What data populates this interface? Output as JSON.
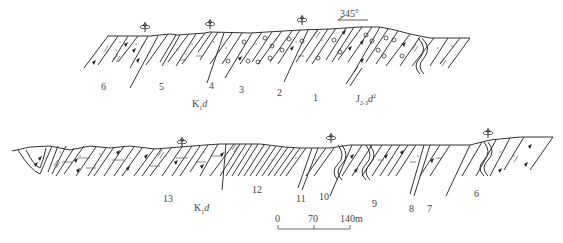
{
  "diagram": {
    "type": "geological-cross-section",
    "profiles": [
      {
        "id": "upper",
        "orientation_label": "345°",
        "bed_numbers": [
          {
            "label": "6",
            "x": 104,
            "y": 88
          },
          {
            "label": "5",
            "x": 162,
            "y": 88
          },
          {
            "label": "4",
            "x": 212,
            "y": 87
          },
          {
            "label": "3",
            "x": 241,
            "y": 91
          },
          {
            "label": "2",
            "x": 280,
            "y": 93
          },
          {
            "label": "1",
            "x": 314,
            "y": 98
          }
        ],
        "formations": [
          {
            "main": "K",
            "sub": "1",
            "name": "d",
            "x": 194,
            "y": 104
          },
          {
            "main": "J",
            "sub": "2-3",
            "name": "d",
            "sup": "2",
            "x": 357,
            "y": 97
          }
        ],
        "fossil_markers": [
          {
            "x": 145,
            "y": 27
          },
          {
            "x": 210,
            "y": 24
          },
          {
            "x": 302,
            "y": 20
          }
        ]
      },
      {
        "id": "lower",
        "bed_numbers": [
          {
            "label": "13",
            "x": 166,
            "y": 200
          },
          {
            "label": "12",
            "x": 254,
            "y": 191
          },
          {
            "label": "11",
            "x": 298,
            "y": 199
          },
          {
            "label": "10",
            "x": 321,
            "y": 197
          },
          {
            "label": "9",
            "x": 373,
            "y": 204
          },
          {
            "label": "8",
            "x": 410,
            "y": 209
          },
          {
            "label": "7",
            "x": 428,
            "y": 209
          },
          {
            "label": "6",
            "x": 476,
            "y": 194
          }
        ],
        "formations": [
          {
            "main": "K",
            "sub": "1",
            "name": "d",
            "x": 195,
            "y": 208
          }
        ],
        "fossil_markers": [
          {
            "x": 182,
            "y": 142
          },
          {
            "x": 331,
            "y": 138
          },
          {
            "x": 488,
            "y": 133
          }
        ]
      }
    ],
    "scale_bar": {
      "ticks": [
        "0",
        "70",
        "140m"
      ],
      "unit": "m"
    }
  }
}
